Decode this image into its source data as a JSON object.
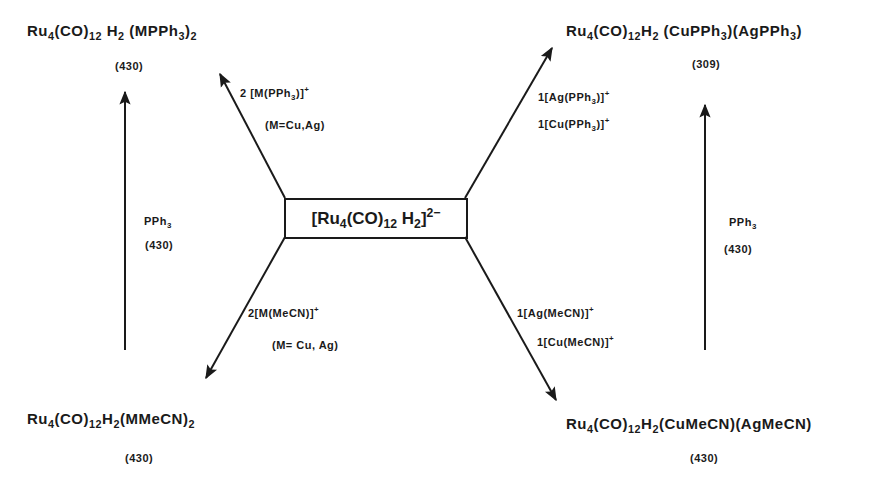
{
  "center": {
    "open": "[",
    "ru": "Ru",
    "ru_sub": "4",
    "co": "(CO)",
    "co_sub": "12",
    "h": "H",
    "h_sub": "2",
    "close": "]",
    "charge": "2−"
  },
  "products": {
    "top_left": {
      "ru": "Ru",
      "ru_sub": "4",
      "co": "(CO)",
      "co_sub": "12",
      "h": "H",
      "h_sub": "2",
      "ligand": "(MPPh",
      "ligand_sub": "3",
      "ligand_close": ")",
      "outer_sub": "2",
      "ref": "(430)"
    },
    "top_right": {
      "ru": "Ru",
      "ru_sub": "4",
      "co": "(CO)",
      "co_sub": "12",
      "h": "H",
      "h_sub": "2",
      "part1": "(CuPPh",
      "part1_sub": "3",
      "part1_close": ")",
      "part2": "(AgPPh",
      "part2_sub": "3",
      "part2_close": ")",
      "ref": "(309)"
    },
    "bottom_left": {
      "ru": "Ru",
      "ru_sub": "4",
      "co": "(CO)",
      "co_sub": "12",
      "h": "H",
      "h_sub": "2",
      "ligand": "(MMeCN)",
      "outer_sub": "2",
      "ref": "(430)"
    },
    "bottom_right": {
      "ru": "Ru",
      "ru_sub": "4",
      "co": "(CO)",
      "co_sub": "12",
      "h": "H",
      "h_sub": "2",
      "ligand": "(CuMeCN)(AgMeCN)",
      "ref": "(430)"
    }
  },
  "reagents": {
    "upper_left": {
      "line1": "2 [M(PPh",
      "line1_sub": "3",
      "line1_close": ")]",
      "charge": "+",
      "line2": "(M=Cu,Ag)"
    },
    "upper_right": {
      "line1": "1[Ag(PPh",
      "line1_sub": "3",
      "line1_close": ")]",
      "charge1": "+",
      "line2": "1[Cu(PPh",
      "line2_sub": "3",
      "line2_close": ")]",
      "charge2": "+"
    },
    "lower_left": {
      "line1": "2[M(MeCN)]",
      "charge": "+",
      "line2": "(M= Cu, Ag)"
    },
    "lower_right": {
      "line1": "1[Ag(MeCN)]",
      "charge1": "+",
      "line2": "1[Cu(MeCN)]",
      "charge2": "+"
    },
    "left_vertical": {
      "reagent": "PPh",
      "reagent_sub": "3",
      "ref": "(430)"
    },
    "right_vertical": {
      "reagent": "PPh",
      "reagent_sub": "3",
      "ref": "(430)"
    }
  },
  "colors": {
    "ink": "#1a1a1a",
    "background": "#ffffff"
  }
}
